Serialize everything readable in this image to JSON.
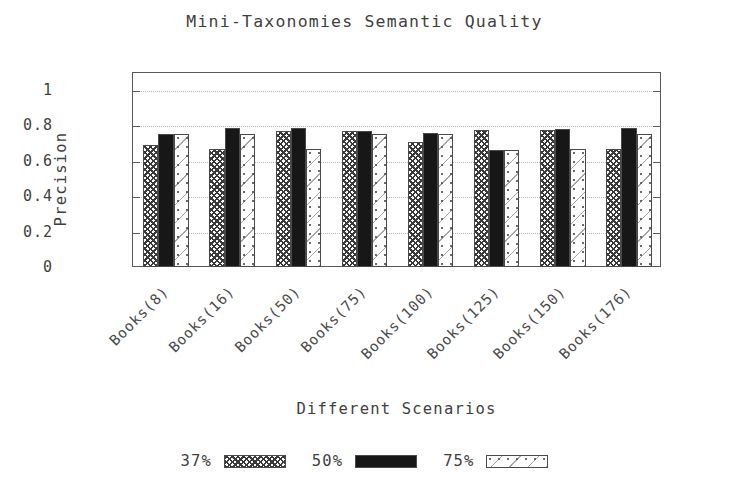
{
  "chart_data": {
    "type": "bar",
    "title": "Mini-Taxonomies Semantic Quality",
    "xlabel": "Different Scenarios",
    "ylabel": "Precision",
    "grid": true,
    "legend_position": "bottom",
    "ylim": [
      0,
      1.1
    ],
    "yticks": [
      0,
      0.2,
      0.4,
      0.6,
      0.8,
      1
    ],
    "ytick_labels": [
      "0",
      "0.2",
      "0.4",
      "0.6",
      "0.8",
      "1"
    ],
    "categories": [
      "Books(8)",
      "Books(16)",
      "Books(50)",
      "Books(75)",
      "Books(100)",
      "Books(125)",
      "Books(150)",
      "Books(176)"
    ],
    "series": [
      {
        "name": "37%",
        "pattern": "crosshatch",
        "values": [
          0.69,
          0.665,
          0.77,
          0.765,
          0.705,
          0.775,
          0.775,
          0.665
        ]
      },
      {
        "name": "50%",
        "pattern": "solid-black",
        "values": [
          0.75,
          0.785,
          0.785,
          0.765,
          0.755,
          0.66,
          0.78,
          0.785
        ]
      },
      {
        "name": "75%",
        "pattern": "light-dots",
        "values": [
          0.75,
          0.75,
          0.665,
          0.75,
          0.75,
          0.66,
          0.665,
          0.75
        ]
      }
    ]
  },
  "colors": {
    "axis": "#5a5a5a",
    "grid": "#b9b9b9",
    "text": "#3f3f3f",
    "series_50": "#171717",
    "background": "#ffffff"
  }
}
